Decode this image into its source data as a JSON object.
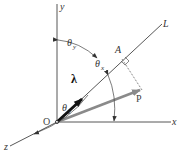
{
  "diagram": {
    "type": "3d-vector-direction-cosines",
    "axes": {
      "x": {
        "label": "x"
      },
      "y": {
        "label": "y"
      },
      "z": {
        "label": "z"
      }
    },
    "origin": {
      "label": "O"
    },
    "line": {
      "label": "L"
    },
    "point": {
      "label": "A"
    },
    "unit_vector": {
      "label": "λ",
      "color": "#111111"
    },
    "force_vector": {
      "label": "P",
      "color": "#8a8a8a"
    },
    "angles": {
      "theta_x": {
        "symbol": "θ",
        "subscript": "x"
      },
      "theta_y": {
        "symbol": "θ",
        "subscript": "y"
      },
      "theta_z": {
        "symbol": "θ",
        "subscript": "z"
      }
    },
    "colors": {
      "line": "#444444",
      "background": "#ffffff"
    }
  }
}
